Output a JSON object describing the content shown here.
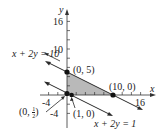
{
  "figure": {
    "type": "linear-programming feasible region graph",
    "axes": {
      "x_label": "x",
      "y_label": "y",
      "x_ticks_labeled": [
        "-4",
        "16"
      ],
      "y_ticks_labeled": [
        "16",
        "10",
        "-4"
      ]
    },
    "lines": [
      {
        "equation": "x + 2y = 10",
        "points": [
          [
            0,
            5
          ],
          [
            10,
            0
          ]
        ]
      },
      {
        "equation": "x + 2y = 1",
        "points": [
          [
            0,
            0.5
          ],
          [
            1,
            0
          ]
        ]
      }
    ],
    "vertices": [
      {
        "label": "(0, 5)",
        "x": 0,
        "y": 5
      },
      {
        "label": "(10, 0)",
        "x": 10,
        "y": 0
      },
      {
        "label": "(1, 0)",
        "x": 1,
        "y": 0
      },
      {
        "label_prefix": "(0, ",
        "label_num": "1",
        "label_den": "2",
        "label_suffix": ")",
        "x": 0,
        "y": 0.5
      }
    ],
    "shaded_region": "quadrilateral bounded by (0,1/2), (0,5), (10,0), (1,0)",
    "colors": {
      "axis": "#333333",
      "line": "#2a2a2a",
      "shade": "#b9b9b9",
      "point": "#111111"
    }
  }
}
